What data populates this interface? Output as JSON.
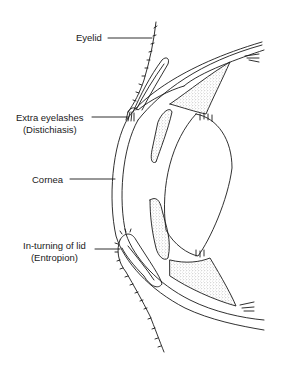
{
  "diagram": {
    "labels": {
      "eyelid": {
        "text": "Eyelid"
      },
      "extra_eyelashes": {
        "line1": "Extra eyelashes",
        "line2": "(Distichiasis)"
      },
      "cornea": {
        "text": "Cornea"
      },
      "inturning": {
        "line1": "In-turning of lid",
        "line2": "(Entropion)"
      }
    },
    "colors": {
      "ink": "#1a1a1a",
      "background": "#ffffff",
      "stipple": "#8a8a8a"
    }
  }
}
